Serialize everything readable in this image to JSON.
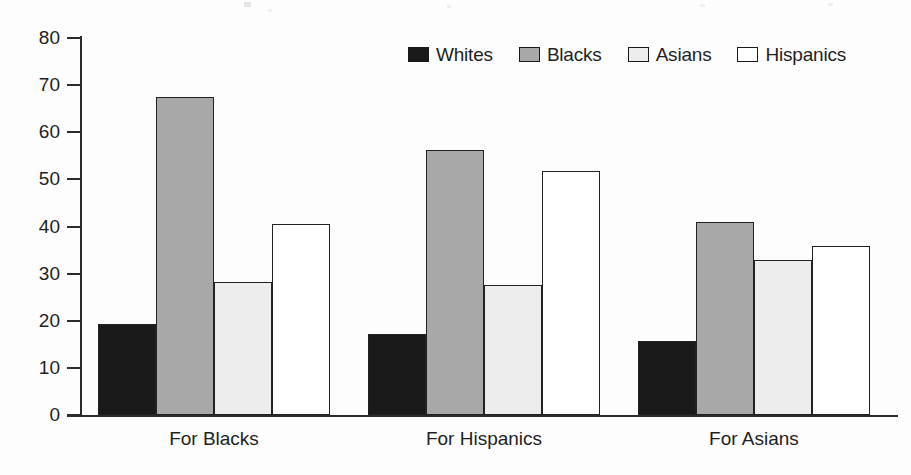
{
  "chart_data": {
    "type": "bar",
    "title": "",
    "subtitle": "",
    "xlabel": "",
    "ylabel": "",
    "categories": [
      "For Blacks",
      "For Hispanics",
      "For Asians"
    ],
    "series": [
      {
        "name": "Whites",
        "values": [
          19.3,
          17.1,
          15.8
        ],
        "color": "#1a1a1a",
        "swatch": "#1a1a1a"
      },
      {
        "name": "Blacks",
        "values": [
          67.4,
          56.3,
          40.9
        ],
        "color": "#a8a8a8",
        "swatch": "#a8a8a8"
      },
      {
        "name": "Asians",
        "values": [
          28.2,
          27.5,
          32.9
        ],
        "color": "#ededed",
        "swatch": "#ededed"
      },
      {
        "name": "Hispanics",
        "values": [
          40.5,
          51.8,
          35.9
        ],
        "color": "#ffffff",
        "swatch": "#ffffff"
      }
    ],
    "ylim": [
      0,
      80
    ],
    "yticks": [
      0,
      10,
      20,
      30,
      40,
      50,
      60,
      70,
      80
    ],
    "ytick_labels": [
      "0",
      "10",
      "20",
      "30",
      "40",
      "50",
      "60",
      "70",
      "80"
    ],
    "grid": false,
    "legend_position": "top-right",
    "axis_color": "#2b2b2b",
    "bar_border_color": "#222222",
    "background_color": "#fdfdfd"
  },
  "legend": {
    "entries": [
      {
        "label": "Whites"
      },
      {
        "label": "Blacks"
      },
      {
        "label": "Asians"
      },
      {
        "label": "Hispanics"
      }
    ]
  },
  "axis": {
    "y_labels": [
      "80",
      "70",
      "60",
      "50",
      "40",
      "30",
      "20",
      "10",
      "0"
    ],
    "x_labels": [
      "For Blacks",
      "For Hispanics",
      "For Asians"
    ]
  }
}
